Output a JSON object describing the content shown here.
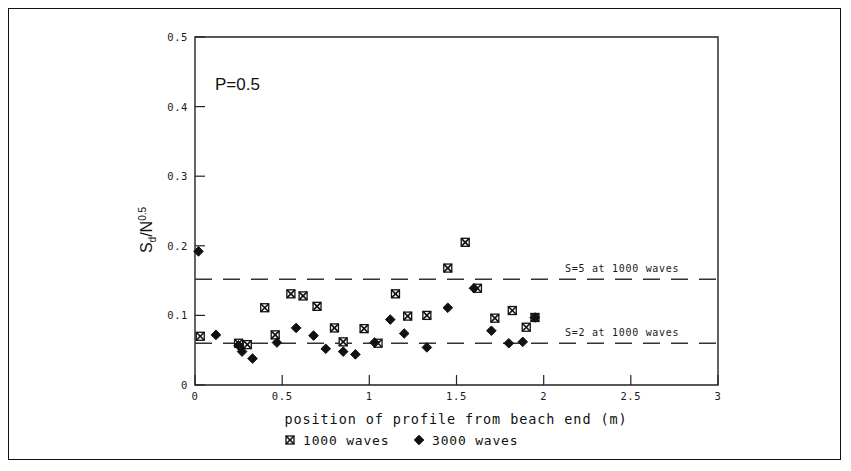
{
  "figure": {
    "panel_label": "P=0.5",
    "border_color": "#111111",
    "background": "#ffffff"
  },
  "chart_data": {
    "type": "scatter",
    "title": "",
    "panel_annotation": "P=0.5",
    "xlabel": "position of profile from beach end (m)",
    "ylabel": "Sd/N0.5",
    "ylabel_main": "S",
    "ylabel_sub": "d",
    "ylabel_num": "/N",
    "ylabel_exp": "0.5",
    "xlim": [
      0,
      3
    ],
    "ylim": [
      0,
      0.5
    ],
    "xticks": [
      0,
      0.5,
      1,
      1.5,
      2,
      2.5,
      3
    ],
    "xtick_labels": [
      "0",
      "0.5",
      "1",
      "1.5",
      "2",
      "2.5",
      "3"
    ],
    "yticks": [
      0,
      0.1,
      0.2,
      0.3,
      0.4,
      0.5
    ],
    "ytick_labels": [
      "0",
      "0.1",
      "0.2",
      "0.3",
      "0.4",
      "0.5"
    ],
    "grid": false,
    "legend_position": "below-axis",
    "marker_colors": {
      "1000 waves": "#111111",
      "3000 waves": "#111111"
    },
    "series": [
      {
        "name": "1000 waves",
        "marker": "crossed-square",
        "points": [
          [
            0.03,
            0.07
          ],
          [
            0.25,
            0.06
          ],
          [
            0.3,
            0.058
          ],
          [
            0.4,
            0.111
          ],
          [
            0.46,
            0.072
          ],
          [
            0.55,
            0.131
          ],
          [
            0.62,
            0.128
          ],
          [
            0.7,
            0.113
          ],
          [
            0.8,
            0.082
          ],
          [
            0.85,
            0.062
          ],
          [
            0.97,
            0.081
          ],
          [
            1.05,
            0.06
          ],
          [
            1.15,
            0.131
          ],
          [
            1.22,
            0.099
          ],
          [
            1.33,
            0.1
          ],
          [
            1.45,
            0.168
          ],
          [
            1.55,
            0.205
          ],
          [
            1.62,
            0.139
          ],
          [
            1.72,
            0.096
          ],
          [
            1.82,
            0.107
          ],
          [
            1.9,
            0.083
          ],
          [
            1.95,
            0.097
          ]
        ]
      },
      {
        "name": "3000 waves",
        "marker": "filled-diamond",
        "points": [
          [
            0.02,
            0.192
          ],
          [
            0.12,
            0.072
          ],
          [
            0.25,
            0.057
          ],
          [
            0.27,
            0.048
          ],
          [
            0.33,
            0.038
          ],
          [
            0.47,
            0.061
          ],
          [
            0.58,
            0.082
          ],
          [
            0.68,
            0.071
          ],
          [
            0.75,
            0.052
          ],
          [
            0.85,
            0.048
          ],
          [
            0.92,
            0.044
          ],
          [
            1.03,
            0.061
          ],
          [
            1.12,
            0.094
          ],
          [
            1.2,
            0.074
          ],
          [
            1.33,
            0.054
          ],
          [
            1.45,
            0.111
          ],
          [
            1.6,
            0.139
          ],
          [
            1.7,
            0.078
          ],
          [
            1.8,
            0.06
          ],
          [
            1.88,
            0.062
          ],
          [
            1.95,
            0.097
          ]
        ]
      }
    ],
    "reference_lines": [
      {
        "label": "S=5 at 1000 waves",
        "y": 0.152,
        "style": "dashed"
      },
      {
        "label": "S=2 at 1000 waves",
        "y": 0.06,
        "style": "dashed"
      }
    ]
  },
  "legend": {
    "items": [
      {
        "label": "1000 waves",
        "marker": "crossed-square"
      },
      {
        "label": "3000 waves",
        "marker": "filled-diamond"
      }
    ]
  }
}
